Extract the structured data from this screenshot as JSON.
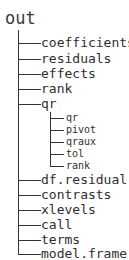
{
  "root": {
    "label": "out"
  },
  "items": [
    {
      "label": "coefficients",
      "y": 43
    },
    {
      "label": "residuals",
      "y": 59
    },
    {
      "label": "effects",
      "y": 74
    },
    {
      "label": "rank",
      "y": 89
    },
    {
      "label": "qr",
      "y": 104
    },
    {
      "label": "df.residual",
      "y": 180
    },
    {
      "label": "contrasts",
      "y": 195
    },
    {
      "label": "xlevels",
      "y": 210
    },
    {
      "label": "call",
      "y": 225
    },
    {
      "label": "terms",
      "y": 240
    },
    {
      "label": "model.frame",
      "y": 254
    }
  ],
  "qr_children": [
    {
      "label": "qr",
      "y": 118
    },
    {
      "label": "pivot",
      "y": 130
    },
    {
      "label": "qraux",
      "y": 142
    },
    {
      "label": "tol",
      "y": 154
    },
    {
      "label": "rank",
      "y": 166
    }
  ],
  "colors": {
    "line": "#333333",
    "text": "#2e2e2e"
  }
}
